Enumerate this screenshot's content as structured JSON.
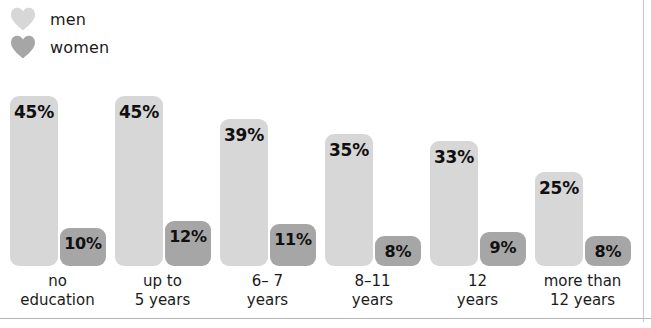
{
  "legend": {
    "items": [
      {
        "label": "men",
        "icon": "heart-icon",
        "color": "#d7d7d7"
      },
      {
        "label": "women",
        "icon": "heart-icon",
        "color": "#a6a6a6"
      }
    ]
  },
  "chart_data": {
    "type": "bar",
    "title": "",
    "subtitle": "",
    "xlabel": "",
    "ylabel": "",
    "ylim": [
      0,
      50
    ],
    "grid": false,
    "legend_position": "top-left",
    "value_suffix": "%",
    "categories": [
      "no\neducation",
      "up to\n5 years",
      "6– 7\nyears",
      "8–11\nyears",
      "12\nyears",
      "more than\n12 years"
    ],
    "category_lines": [
      [
        "no",
        "education"
      ],
      [
        "up to",
        "5 years"
      ],
      [
        "6– 7",
        "years"
      ],
      [
        "8–11",
        "years"
      ],
      [
        "12",
        "years"
      ],
      [
        "more than",
        "12 years"
      ]
    ],
    "series": [
      {
        "name": "men",
        "color": "#d7d7d7",
        "values": [
          45,
          45,
          39,
          35,
          33,
          25
        ],
        "labels": [
          "45%",
          "45%",
          "39%",
          "35%",
          "33%",
          "25%"
        ]
      },
      {
        "name": "women",
        "color": "#a6a6a6",
        "values": [
          10,
          12,
          11,
          8,
          9,
          8
        ],
        "labels": [
          "10%",
          "12%",
          "11%",
          "8%",
          "9%",
          "8%"
        ]
      }
    ]
  }
}
